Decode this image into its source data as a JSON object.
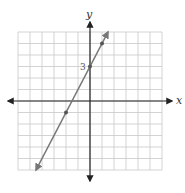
{
  "chart_data": {
    "type": "line",
    "title": "",
    "xlabel": "x",
    "ylabel": "y",
    "xlim": [
      -6,
      6
    ],
    "ylim": [
      -6,
      6
    ],
    "grid": true,
    "equation": "y = 2x + 3",
    "series": [
      {
        "name": "line",
        "x": [
          -4.5,
          -2,
          0,
          1,
          1.5
        ],
        "y": [
          -6,
          -1,
          3,
          5,
          6
        ],
        "marked_points": [
          {
            "x": -2,
            "y": -1
          },
          {
            "x": 0,
            "y": 3
          },
          {
            "x": 1,
            "y": 5
          }
        ]
      }
    ],
    "annotations": [
      {
        "text": "3",
        "x": 0,
        "y": 3,
        "position": "left of y-axis"
      }
    ]
  },
  "labels": {
    "x_axis": "x",
    "y_axis": "y",
    "y_intercept": "3"
  },
  "colors": {
    "grid": "#c8c8c8",
    "axis": "#222222",
    "line": "#777777"
  }
}
